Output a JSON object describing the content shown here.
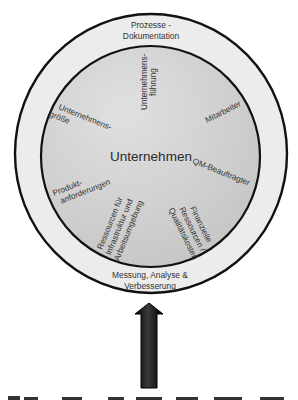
{
  "diagram": {
    "center_label": "Unternehmen",
    "outer_ring": {
      "top_label": [
        "Prozesse -",
        "Dokumentation"
      ],
      "bottom_label": [
        "Messung, Analyse &",
        "Verbesserung"
      ]
    },
    "factors": [
      {
        "lines": [
          "Unternehmens-",
          "führung"
        ]
      },
      {
        "lines": [
          "Mitarbeiter"
        ]
      },
      {
        "lines": [
          "QM-Beauftragter"
        ]
      },
      {
        "lines": [
          "Finanzielle",
          "Ressourcen /",
          "Qualitätskosten"
        ]
      },
      {
        "lines": [
          "Ressourcen für",
          "Infrastruktur und",
          "Arbeitsumgebung"
        ]
      },
      {
        "lines": [
          "Produkt-",
          "anforderungen"
        ]
      },
      {
        "lines": [
          "Unternehmens-",
          "größe"
        ]
      }
    ],
    "arrow": {
      "direction": "up",
      "color": "#111111"
    },
    "caption_partial": "Abbildung ... (cut off)"
  },
  "colors": {
    "outer_ring_fill": "#ececec",
    "inner_circle_light": "#dcdcdc",
    "inner_circle_dark": "#c6c6c6",
    "stroke": "#111111"
  }
}
